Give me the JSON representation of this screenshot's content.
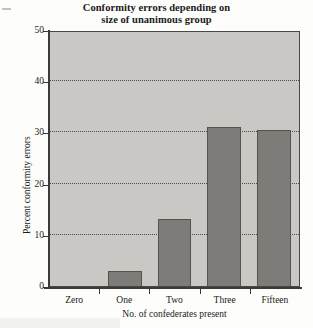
{
  "chart_data": {
    "type": "bar",
    "title": "Conformity errors depending on size of unanimous group",
    "title_lines": [
      "Conformity errors depending on",
      "size of unanimous group"
    ],
    "xlabel": "No. of confederates present",
    "ylabel": "Percent conformity errors",
    "categories": [
      "Zero",
      "One",
      "Two",
      "Three",
      "Fifteen"
    ],
    "values": [
      0,
      3,
      13,
      31,
      30.5
    ],
    "ylim": [
      0,
      50
    ],
    "yticks": [
      0,
      10,
      20,
      30,
      40,
      50
    ],
    "ytick_labels": [
      "0",
      "10",
      "20",
      "30",
      "40",
      "50"
    ],
    "grid": true,
    "grid_axis": "y",
    "grid_style": "dotted",
    "legend": false,
    "colors": {
      "bar_fill": "#7e7c79",
      "bar_edge": "#56534f",
      "plot_background": "#c9c8c4",
      "axis": "#3c3a36",
      "gridline": "#4d4b47",
      "page_background": "#fdfdfc",
      "text": "#1a1a1a"
    }
  }
}
